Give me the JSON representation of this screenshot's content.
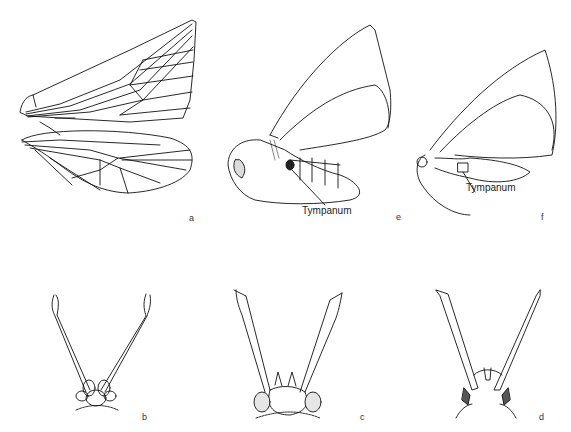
{
  "figure": {
    "panels": [
      {
        "id": "a",
        "label": "a",
        "subject": "forewing and hindwing venation"
      },
      {
        "id": "e",
        "label": "e",
        "subject": "moth lateral view with tympanum",
        "annotation": "Tympanum"
      },
      {
        "id": "f",
        "label": "f",
        "subject": "moth lateral view with tympanum",
        "annotation": "Tympanum"
      },
      {
        "id": "b",
        "label": "b",
        "subject": "head with antennae, frontal view"
      },
      {
        "id": "c",
        "label": "c",
        "subject": "head with antennae, frontal view"
      },
      {
        "id": "d",
        "label": "d",
        "subject": "head with antennae, frontal view"
      }
    ]
  }
}
